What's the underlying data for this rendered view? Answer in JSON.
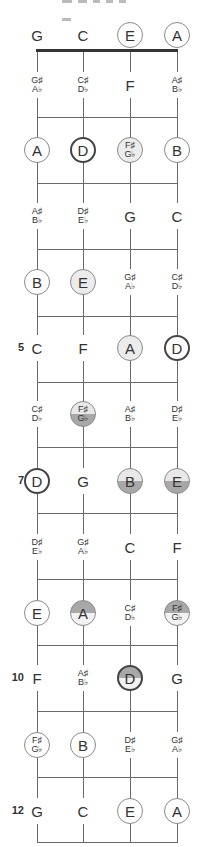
{
  "diagram": {
    "type": "ukulele-fretboard",
    "strings": [
      "G",
      "C",
      "E",
      "A"
    ],
    "string_x": [
      37,
      83,
      130,
      177
    ],
    "nut_y": 50,
    "fret_y": [
      117,
      183,
      249,
      316,
      382,
      447,
      513,
      579,
      645,
      711,
      777,
      842
    ],
    "row_y": [
      35,
      85,
      150,
      216,
      282,
      348,
      414,
      481,
      547,
      613,
      678,
      745,
      811
    ],
    "fret_markers": [
      {
        "fret": 5,
        "label": "5"
      },
      {
        "fret": 7,
        "label": "7"
      },
      {
        "fret": 10,
        "label": "10"
      },
      {
        "fret": 12,
        "label": "12"
      }
    ],
    "colors": {
      "line": "#6a6a6a",
      "nut": "#333333",
      "text": "#333333",
      "fill_dark": "#a8a8a8",
      "fill_light": "#e8e8e8"
    },
    "rows": [
      {
        "fret": 0,
        "notes": [
          {
            "label": "G",
            "style": "plain"
          },
          {
            "label": "C",
            "style": "plain"
          },
          {
            "label": "E",
            "style": "circle"
          },
          {
            "label": "A",
            "style": "circle"
          }
        ]
      },
      {
        "fret": 1,
        "notes": [
          {
            "label": "G♯",
            "label2": "A♭",
            "style": "plain"
          },
          {
            "label": "C♯",
            "label2": "D♭",
            "style": "plain"
          },
          {
            "label": "F",
            "style": "plain"
          },
          {
            "label": "A♯",
            "label2": "B♭",
            "style": "plain"
          }
        ]
      },
      {
        "fret": 2,
        "notes": [
          {
            "label": "A",
            "style": "circle"
          },
          {
            "label": "D",
            "style": "root"
          },
          {
            "label": "F♯",
            "label2": "G♭",
            "style": "circle-light"
          },
          {
            "label": "B",
            "style": "circle"
          }
        ]
      },
      {
        "fret": 3,
        "notes": [
          {
            "label": "A♯",
            "label2": "B♭",
            "style": "plain"
          },
          {
            "label": "D♯",
            "label2": "E♭",
            "style": "plain"
          },
          {
            "label": "G",
            "style": "plain"
          },
          {
            "label": "C",
            "style": "plain"
          }
        ]
      },
      {
        "fret": 4,
        "notes": [
          {
            "label": "B",
            "style": "circle"
          },
          {
            "label": "E",
            "style": "circle-light"
          },
          {
            "label": "G♯",
            "label2": "A♭",
            "style": "plain"
          },
          {
            "label": "C♯",
            "label2": "D♭",
            "style": "plain"
          }
        ]
      },
      {
        "fret": 5,
        "notes": [
          {
            "label": "C",
            "style": "plain"
          },
          {
            "label": "F",
            "style": "plain"
          },
          {
            "label": "A",
            "style": "circle-light"
          },
          {
            "label": "D",
            "style": "root"
          }
        ]
      },
      {
        "fret": 6,
        "notes": [
          {
            "label": "C♯",
            "label2": "D♭",
            "style": "plain"
          },
          {
            "label": "F♯",
            "label2": "G♭",
            "style": "circle-fill-bottom"
          },
          {
            "label": "A♯",
            "label2": "B♭",
            "style": "plain"
          },
          {
            "label": "D♯",
            "label2": "E♭",
            "style": "plain"
          }
        ]
      },
      {
        "fret": 7,
        "notes": [
          {
            "label": "D",
            "style": "root"
          },
          {
            "label": "G",
            "style": "plain"
          },
          {
            "label": "B",
            "style": "circle-fill-bottom"
          },
          {
            "label": "E",
            "style": "circle-fill-bottom"
          }
        ]
      },
      {
        "fret": 8,
        "notes": [
          {
            "label": "D♯",
            "label2": "E♭",
            "style": "plain"
          },
          {
            "label": "G♯",
            "label2": "A♭",
            "style": "plain"
          },
          {
            "label": "C",
            "style": "plain"
          },
          {
            "label": "F",
            "style": "plain"
          }
        ]
      },
      {
        "fret": 9,
        "notes": [
          {
            "label": "E",
            "style": "circle"
          },
          {
            "label": "A",
            "style": "circle-fill-top"
          },
          {
            "label": "C♯",
            "label2": "D♭",
            "style": "plain"
          },
          {
            "label": "F♯",
            "label2": "G♭",
            "style": "circle-fill-top"
          }
        ]
      },
      {
        "fret": 10,
        "notes": [
          {
            "label": "F",
            "style": "plain"
          },
          {
            "label": "A♯",
            "label2": "B♭",
            "style": "plain"
          },
          {
            "label": "D",
            "style": "root-fill-top"
          },
          {
            "label": "G",
            "style": "plain"
          }
        ]
      },
      {
        "fret": 11,
        "notes": [
          {
            "label": "F♯",
            "label2": "G♭",
            "style": "circle"
          },
          {
            "label": "B",
            "style": "circle"
          },
          {
            "label": "D♯",
            "label2": "E♭",
            "style": "plain"
          },
          {
            "label": "G♯",
            "label2": "A♭",
            "style": "plain"
          }
        ]
      },
      {
        "fret": 12,
        "notes": [
          {
            "label": "G",
            "style": "plain"
          },
          {
            "label": "C",
            "style": "plain"
          },
          {
            "label": "E",
            "style": "circle"
          },
          {
            "label": "A",
            "style": "circle"
          }
        ]
      }
    ]
  }
}
